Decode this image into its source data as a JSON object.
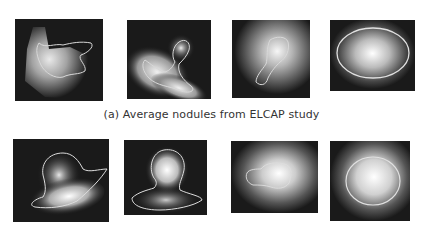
{
  "figure": {
    "caption_a": "(a) Average nodules from ELCAP study",
    "row_a": [
      {
        "id": "a1",
        "shape": "irregular-branching"
      },
      {
        "id": "a2",
        "shape": "stalked-lobe"
      },
      {
        "id": "a3",
        "shape": "small-elongated"
      },
      {
        "id": "a4",
        "shape": "ellipse"
      }
    ],
    "row_b": [
      {
        "id": "b1",
        "shape": "head-with-tail"
      },
      {
        "id": "b2",
        "shape": "mushroom"
      },
      {
        "id": "b3",
        "shape": "irregular-blob"
      },
      {
        "id": "b4",
        "shape": "circle"
      }
    ],
    "colors": {
      "background": "#1a1a1a",
      "contour": "#e8e8e8"
    }
  }
}
